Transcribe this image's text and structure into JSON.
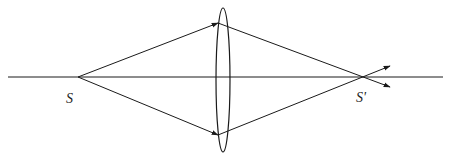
{
  "diagram": {
    "type": "optics-ray-diagram",
    "colors": {
      "stroke": "#1a1a1a",
      "background": "#ffffff"
    },
    "labels": {
      "source": "S",
      "image": "S'"
    },
    "elements": {
      "optical_axis": {
        "x1": 8,
        "y1": 77,
        "x2": 443,
        "y2": 77
      },
      "source_point": {
        "x": 78,
        "y": 77
      },
      "image_point": {
        "x": 364,
        "y": 77
      },
      "lens": {
        "cx": 223,
        "cy": 80,
        "rx": 7,
        "ry": 72
      },
      "rays": [
        {
          "name": "upper-incident-ray",
          "from": [
            78,
            77
          ],
          "to": [
            218,
            23
          ]
        },
        {
          "name": "lower-incident-ray",
          "from": [
            78,
            77
          ],
          "to": [
            218,
            135
          ]
        },
        {
          "name": "upper-refracted-ray",
          "from": [
            218,
            23
          ],
          "to": [
            390,
            87
          ]
        },
        {
          "name": "lower-refracted-ray",
          "from": [
            218,
            135
          ],
          "to": [
            390,
            66
          ]
        }
      ]
    }
  }
}
